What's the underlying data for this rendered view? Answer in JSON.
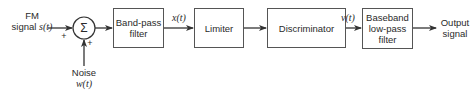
{
  "diagram": {
    "input": {
      "line1": "FM",
      "line2_text": "signal ",
      "line2_var": "s(t)"
    },
    "summer": {
      "symbol": "Σ",
      "sign_left": "+",
      "sign_bottom": "+"
    },
    "noise": {
      "line1": "Noise",
      "line2": "w(t)"
    },
    "blocks": [
      {
        "id": "bandpass",
        "lines": [
          "Band-pass",
          "filter"
        ]
      },
      {
        "id": "limiter",
        "lines": [
          "Limiter"
        ]
      },
      {
        "id": "discriminator",
        "lines": [
          "Discriminator"
        ]
      },
      {
        "id": "baseband",
        "lines": [
          "Baseband",
          "low-pass",
          "filter"
        ]
      }
    ],
    "signals": {
      "after_bandpass": "x(t)",
      "after_discriminator": "v(t)"
    },
    "output": {
      "line1": "Output",
      "line2": "signal"
    },
    "colors": {
      "stroke": "#444444",
      "text": "#2a2a2a",
      "background": "#ffffff"
    }
  }
}
